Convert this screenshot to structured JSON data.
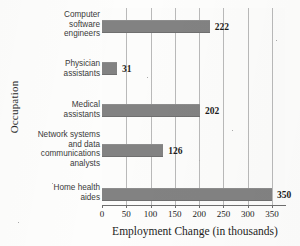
{
  "chart_data": {
    "type": "bar",
    "orientation": "horizontal",
    "title": "",
    "xlabel": "Employment Change (in thousands)",
    "ylabel": "Occupation",
    "categories": [
      "Computer software engineers",
      "Physician assistants",
      "Medical assistants",
      "Network systems and data communications analysts",
      "Home health aides"
    ],
    "category_lines": [
      [
        "Computer",
        "software",
        "engineers"
      ],
      [
        "Physician",
        "assistants"
      ],
      [
        "Medical",
        "assistants"
      ],
      [
        "Network systems",
        "and data",
        "communications",
        "analysts"
      ],
      [
        "Home health",
        "aides"
      ]
    ],
    "values": [
      222,
      31,
      202,
      126,
      350
    ],
    "value_labels": [
      "222",
      "31",
      "202",
      "126",
      "350"
    ],
    "xlim": [
      0,
      375
    ],
    "xticks": [
      0,
      50,
      100,
      150,
      200,
      250,
      300,
      350
    ],
    "xtick_labels": [
      "0",
      "50",
      "100",
      "150",
      "200",
      "250",
      "300",
      "350"
    ],
    "grid": "vertical",
    "legend": "none",
    "bar_color": "#828282",
    "axis_color": "#6e6e6e",
    "gridline_color": "#b9b9b9",
    "background_color": "#fcfcfb"
  }
}
